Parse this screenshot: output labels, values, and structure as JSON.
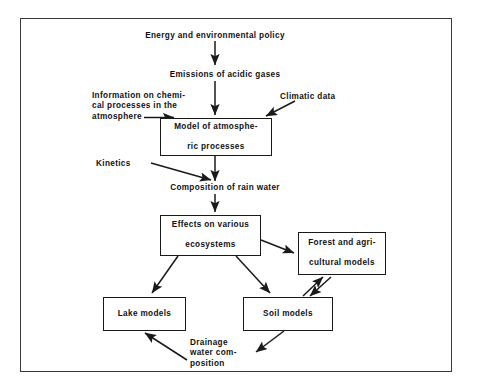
{
  "diagram": {
    "frame": {
      "name": "outer-border"
    },
    "nodes": [
      {
        "id": "model-atmospheric",
        "lines": [
          "Model of atmosphe-",
          "ric processes"
        ],
        "shape": "box"
      },
      {
        "id": "effects-ecosystems",
        "lines": [
          "Effects on various",
          "ecosystems"
        ],
        "shape": "box"
      },
      {
        "id": "forest-agricultural",
        "lines": [
          "Forest and agri-",
          "cultural models"
        ],
        "shape": "box"
      },
      {
        "id": "lake-models",
        "lines": [
          "Lake models"
        ],
        "shape": "box"
      },
      {
        "id": "soil-models",
        "lines": [
          "Soil models"
        ],
        "shape": "box"
      }
    ],
    "labels": [
      {
        "id": "energy-policy",
        "lines": [
          "Energy and environmental policy"
        ]
      },
      {
        "id": "emissions",
        "lines": [
          "Emissions of acidic gases"
        ]
      },
      {
        "id": "information-chemical",
        "lines": [
          "Information on chemi-",
          "cal  processes in the",
          "atmosphere"
        ]
      },
      {
        "id": "climatic-data",
        "lines": [
          "Climatic data"
        ]
      },
      {
        "id": "kinetics",
        "lines": [
          "Kinetics"
        ]
      },
      {
        "id": "rain-water",
        "lines": [
          "Composition of rain water"
        ]
      },
      {
        "id": "drainage",
        "lines": [
          "Drainage",
          "water com-",
          "position"
        ]
      }
    ],
    "colors": {
      "background": "#ffffff",
      "stroke": "#1a1a1a",
      "frame_stroke": "#3a3a3a",
      "text": "#111111"
    }
  }
}
